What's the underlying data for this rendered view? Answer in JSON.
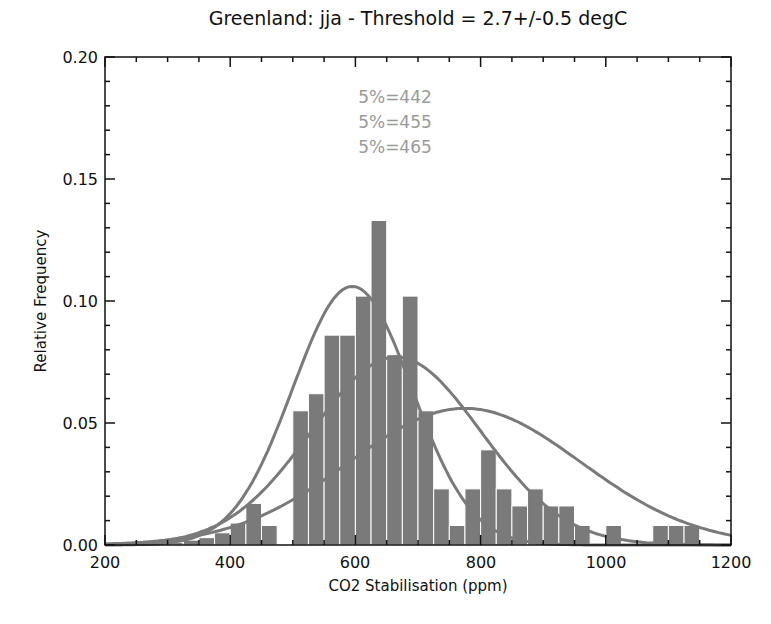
{
  "chart_data": {
    "type": "bar",
    "title": "Greenland: jja - Threshold = 2.7+/-0.5 degC",
    "xlabel": "CO2 Stabilisation (ppm)",
    "ylabel": "Relative Frequency",
    "xlim": [
      200,
      1200
    ],
    "ylim": [
      0,
      0.2
    ],
    "xticks": [
      "200",
      "400",
      "600",
      "800",
      "1000",
      "1200"
    ],
    "yticks": [
      "0.00",
      "0.05",
      "0.10",
      "0.15",
      "0.20"
    ],
    "grid": false,
    "bin_width": 25,
    "histogram": {
      "bin_starts": [
        300,
        325,
        350,
        375,
        400,
        425,
        450,
        500,
        525,
        550,
        575,
        600,
        625,
        650,
        675,
        700,
        725,
        750,
        775,
        800,
        825,
        850,
        875,
        900,
        925,
        950,
        1000,
        1075,
        1100,
        1125
      ],
      "values": [
        0.001,
        0.002,
        0.003,
        0.005,
        0.009,
        0.017,
        0.008,
        0.055,
        0.062,
        0.086,
        0.086,
        0.102,
        0.133,
        0.078,
        0.102,
        0.055,
        0.023,
        0.008,
        0.023,
        0.039,
        0.023,
        0.016,
        0.023,
        0.016,
        0.016,
        0.008,
        0.008,
        0.008,
        0.008,
        0.008
      ]
    },
    "series": [
      {
        "name": "fit-442",
        "type": "line",
        "peak_x": 595,
        "peak_y": 0.106,
        "sigma": 95
      },
      {
        "name": "fit-455",
        "type": "line",
        "peak_x": 665,
        "peak_y": 0.077,
        "sigma": 135
      },
      {
        "name": "fit-465",
        "type": "line",
        "peak_x": 775,
        "peak_y": 0.056,
        "sigma": 185
      }
    ],
    "annotations": [
      "5%=442",
      "5%=455",
      "5%=465"
    ],
    "colors": {
      "bars": "#7a7a7a",
      "curves": "#7a7a7a",
      "annotations": "#9a9a9a",
      "axes": "#111111"
    }
  }
}
